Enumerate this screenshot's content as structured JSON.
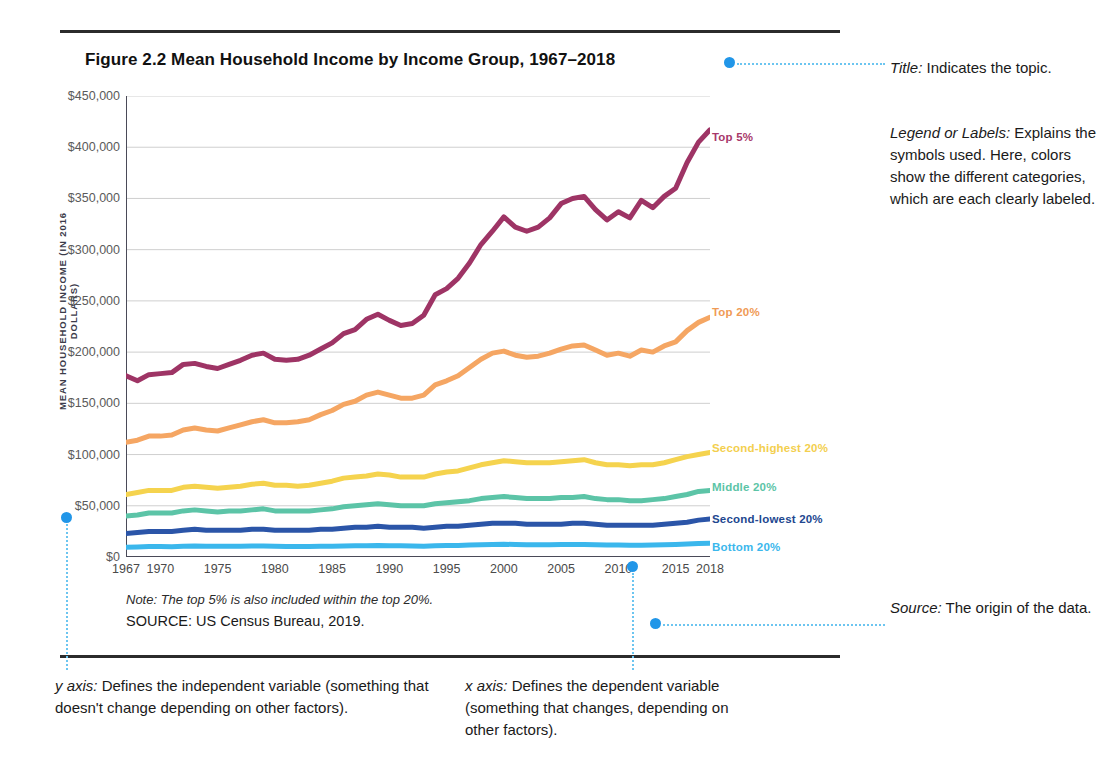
{
  "figure": {
    "title": "Figure 2.2  Mean Household Income by Income Group, 1967–2018",
    "note": "Note: The top 5% is also included within the top 20%.",
    "source": "SOURCE: US Census Bureau, 2019."
  },
  "annotations": {
    "title_ann": "Title: Indicates the topic.",
    "title_ann_label": "Title:",
    "title_ann_body": " Indicates the topic.",
    "legend_ann_label": "Legend or Labels:",
    "legend_ann_body": " Explains the symbols used. Here, colors show the different categories, which are each clearly labeled.",
    "source_ann_label": "Source:",
    "source_ann_body": " The origin of the data.",
    "y_ann_label": "y axis:",
    "y_ann_body": " Defines the independent variable (something that doesn't change depending on other factors).",
    "x_ann_label": "x axis:",
    "x_ann_body": " Defines the dependent variable (something that changes, depending on other factors)."
  },
  "chart_data": {
    "type": "line",
    "title": "Figure 2.2  Mean Household Income by Income Group, 1967–2018",
    "xlabel": "",
    "ylabel": "MEAN HOUSEHOLD INCOME (IN 2016 DOLLARS)",
    "ylim": [
      0,
      450000
    ],
    "ytick_values": [
      0,
      50000,
      100000,
      150000,
      200000,
      250000,
      300000,
      350000,
      400000,
      450000
    ],
    "ytick_labels": [
      "$0",
      "$50,000",
      "$100,000",
      "$150,000",
      "$200,000",
      "$250,000",
      "$300,000",
      "$350,000",
      "$400,000",
      "$450,000"
    ],
    "xlim": [
      1967,
      2018
    ],
    "xtick_values": [
      1967,
      1970,
      1975,
      1980,
      1985,
      1990,
      1995,
      2000,
      2005,
      2010,
      2015,
      2018
    ],
    "xtick_labels": [
      "1967",
      "1970",
      "1975",
      "1980",
      "1985",
      "1990",
      "1995",
      "2000",
      "2005",
      "2010",
      "2015",
      "2018"
    ],
    "grid": "horizontal",
    "legend_position": "right-inline-labels",
    "x": [
      1967,
      1968,
      1969,
      1970,
      1971,
      1972,
      1973,
      1974,
      1975,
      1976,
      1977,
      1978,
      1979,
      1980,
      1981,
      1982,
      1983,
      1984,
      1985,
      1986,
      1987,
      1988,
      1989,
      1990,
      1991,
      1992,
      1993,
      1994,
      1995,
      1996,
      1997,
      1998,
      1999,
      2000,
      2001,
      2002,
      2003,
      2004,
      2005,
      2006,
      2007,
      2008,
      2009,
      2010,
      2011,
      2012,
      2013,
      2014,
      2015,
      2016,
      2017,
      2018
    ],
    "series": [
      {
        "name": "Top 5%",
        "color": "#9e3465",
        "label_color": "#a8386a",
        "values": [
          177000,
          172000,
          178000,
          179000,
          180000,
          188000,
          189000,
          186000,
          184000,
          188000,
          192000,
          197000,
          199000,
          193000,
          192000,
          193000,
          197000,
          203000,
          209000,
          218000,
          222000,
          232000,
          237000,
          231000,
          226000,
          228000,
          236000,
          256000,
          262000,
          272000,
          287000,
          305000,
          318000,
          332000,
          322000,
          318000,
          322000,
          331000,
          345000,
          350000,
          352000,
          339000,
          329000,
          337000,
          331000,
          348000,
          341000,
          352000,
          360000,
          385000,
          405000,
          417000
        ],
        "label_y_pct": 7.5
      },
      {
        "name": "Top 20%",
        "color": "#f5a663",
        "label_color": "#f09a55",
        "values": [
          112000,
          114000,
          118000,
          118000,
          119000,
          124000,
          126000,
          124000,
          123000,
          126000,
          129000,
          132000,
          134000,
          131000,
          131000,
          132000,
          134000,
          139000,
          143000,
          149000,
          152000,
          158000,
          161000,
          158000,
          155000,
          155000,
          158000,
          168000,
          172000,
          177000,
          185000,
          193000,
          199000,
          201000,
          197000,
          195000,
          196000,
          199000,
          203000,
          206000,
          207000,
          202000,
          197000,
          199000,
          196000,
          202000,
          200000,
          206000,
          210000,
          221000,
          229000,
          234000
        ],
        "label_y_pct": 45.5
      },
      {
        "name": "Second-highest 20%",
        "color": "#f5d34e",
        "label_color": "#f3cf4e",
        "values": [
          61000,
          63000,
          65000,
          65000,
          65000,
          68000,
          69000,
          68000,
          67000,
          68000,
          69000,
          71000,
          72000,
          70000,
          70000,
          69000,
          70000,
          72000,
          74000,
          77000,
          78000,
          79000,
          81000,
          80000,
          78000,
          78000,
          78000,
          81000,
          83000,
          84000,
          87000,
          90000,
          92000,
          94000,
          93000,
          92000,
          92000,
          92000,
          93000,
          94000,
          95000,
          92000,
          90000,
          90000,
          89000,
          90000,
          90000,
          92000,
          95000,
          98000,
          100000,
          102000
        ],
        "label_y_pct": 75.0
      },
      {
        "name": "Middle 20%",
        "color": "#5cc4a7",
        "label_color": "#5cc4a7",
        "values": [
          40000,
          41000,
          43000,
          43000,
          43000,
          45000,
          46000,
          45000,
          44000,
          45000,
          45000,
          46000,
          47000,
          45000,
          45000,
          45000,
          45000,
          46000,
          47000,
          49000,
          50000,
          51000,
          52000,
          51000,
          50000,
          50000,
          50000,
          52000,
          53000,
          54000,
          55000,
          57000,
          58000,
          59000,
          58000,
          57000,
          57000,
          57000,
          58000,
          58000,
          59000,
          57000,
          56000,
          56000,
          55000,
          55000,
          56000,
          57000,
          59000,
          61000,
          64000,
          65000
        ],
        "label_y_pct": 83.5
      },
      {
        "name": "Second-lowest 20%",
        "color": "#2b55a8",
        "label_color": "#22478f",
        "values": [
          23000,
          24000,
          25000,
          25000,
          25000,
          26000,
          27000,
          26000,
          26000,
          26000,
          26000,
          27000,
          27000,
          26000,
          26000,
          26000,
          26000,
          27000,
          27000,
          28000,
          29000,
          29000,
          30000,
          29000,
          29000,
          29000,
          28000,
          29000,
          30000,
          30000,
          31000,
          32000,
          33000,
          33000,
          33000,
          32000,
          32000,
          32000,
          32000,
          33000,
          33000,
          32000,
          31000,
          31000,
          31000,
          31000,
          31000,
          32000,
          33000,
          34000,
          36000,
          37000
        ],
        "label_y_pct": 90.5
      },
      {
        "name": "Bottom 20%",
        "color": "#3bb7ec",
        "label_color": "#3bb7ec",
        "values": [
          9500,
          9800,
          10200,
          10200,
          10100,
          10500,
          10800,
          10600,
          10400,
          10500,
          10500,
          10700,
          10800,
          10400,
          10200,
          10200,
          10200,
          10400,
          10500,
          10800,
          11000,
          11100,
          11300,
          11100,
          10900,
          10800,
          10600,
          10900,
          11200,
          11300,
          11600,
          11900,
          12200,
          12400,
          12200,
          12000,
          12000,
          12000,
          12100,
          12200,
          12300,
          11900,
          11700,
          11700,
          11500,
          11500,
          11700,
          11900,
          12300,
          12800,
          13200,
          13500
        ],
        "label_y_pct": 96.5
      }
    ]
  }
}
